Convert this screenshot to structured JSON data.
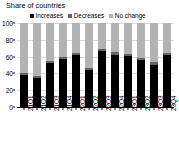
{
  "chart_title": "Share of countries",
  "legend": {
    "position": "top",
    "entries": [
      {
        "label": "Increases",
        "color": "#000000",
        "swatch": "square-swatch-icon"
      },
      {
        "label": "Decreases",
        "color": "#636363",
        "swatch": "square-swatch-icon"
      },
      {
        "label": "No change",
        "color": "#b3b3b3",
        "swatch": "square-swatch-icon"
      }
    ]
  },
  "chart_data": {
    "type": "bar",
    "subtype": "stacked-100-percent",
    "title": "Share of countries",
    "xlabel": "",
    "ylabel": "",
    "ylim": [
      0,
      100
    ],
    "yticks": [
      0,
      20,
      40,
      60,
      80,
      100
    ],
    "ytick_labels": [
      "0",
      "20",
      "40",
      "60",
      "80",
      "100"
    ],
    "grid": true,
    "legend_position": "top",
    "categories": [
      "21Q1",
      "21Q2",
      "21Q3",
      "21Q4",
      "22Q1",
      "22Q2",
      "22Q3",
      "22Q4",
      "23Q1",
      "23Q2",
      "23Q3",
      "23Q4"
    ],
    "series": [
      {
        "name": "Increases",
        "color": "#000000",
        "values": [
          38,
          35,
          52,
          57,
          62,
          44,
          67,
          62,
          61,
          56,
          50,
          62
        ]
      },
      {
        "name": "Decreases",
        "color": "#636363",
        "values": [
          3,
          2,
          3,
          2,
          2,
          3,
          2,
          3,
          2,
          2,
          3,
          2
        ]
      },
      {
        "name": "No change",
        "color": "#b3b3b3",
        "values": [
          59,
          63,
          45,
          41,
          36,
          53,
          31,
          35,
          37,
          42,
          47,
          36
        ]
      }
    ]
  }
}
